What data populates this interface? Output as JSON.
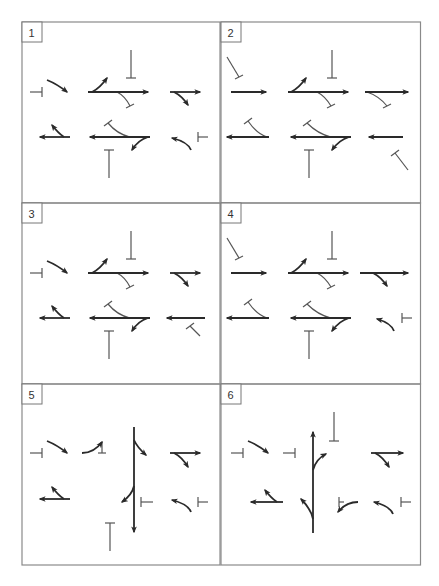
{
  "figure": {
    "grid": {
      "left": 22,
      "top": 22,
      "col_width": 199,
      "row_height": 181,
      "cols": 2,
      "rows": 3
    },
    "colors": {
      "border": "#8a8a8a",
      "arrow": "#2a2a2a",
      "stop_line": "#555555",
      "label_box": "#777777",
      "label_text": "#333333"
    },
    "panels": [
      {
        "label": "1",
        "arrows": [
          {
            "d": "M25 58 Q35 62 45 70"
          },
          {
            "d": "M66 70 L126 70"
          },
          {
            "d": "M70 70 Q78 66 85 56"
          },
          {
            "d": "M148 70 L178 70"
          },
          {
            "d": "M152 70 Q160 74 166 83"
          },
          {
            "d": "M48 115 L18 115"
          },
          {
            "d": "M42 115 Q36 111 30 103"
          },
          {
            "d": "M128 115 L68 115"
          },
          {
            "d": "M126 115 Q116 118 110 128"
          },
          {
            "d": "M169 128 Q166 120 150 116"
          }
        ],
        "stops": [
          {
            "d": "M8 70 L20 70",
            "cap": [
              20,
              65,
              20,
              75
            ]
          },
          {
            "d": "M109 28 L109 56",
            "cap": [
              104,
              56,
              114,
              56
            ]
          },
          {
            "d": "M95 70 Q103 74 108 84",
            "cap": [
              104,
              86,
              112,
              82
            ]
          },
          {
            "d": "M108 115 Q95 112 86 101",
            "cap": [
              82,
              104,
              90,
              98
            ]
          },
          {
            "d": "M87 156 L87 128",
            "cap": [
              82,
              128,
              92,
              128
            ]
          },
          {
            "d": "M186 115 L176 115",
            "cap": [
              176,
              110,
              176,
              120
            ]
          }
        ]
      },
      {
        "label": "2",
        "arrows": [
          {
            "d": "M10 70 L45 70"
          },
          {
            "d": "M67 70 L127 70"
          },
          {
            "d": "M70 70 Q78 66 85 56"
          },
          {
            "d": "M144 70 L187 70"
          },
          {
            "d": "M48 115 L6 115"
          },
          {
            "d": "M130 115 L70 115"
          },
          {
            "d": "M128 115 Q118 118 111 128"
          },
          {
            "d": "M182 115 L148 115"
          }
        ],
        "stops": [
          {
            "d": "M6 35 L18 55",
            "cap": [
              14,
              57,
              22,
              53
            ]
          },
          {
            "d": "M111 28 L111 56",
            "cap": [
              106,
              56,
              116,
              56
            ]
          },
          {
            "d": "M96 70 Q104 74 110 84",
            "cap": [
              106,
              86,
              114,
              82
            ]
          },
          {
            "d": "M146 70 Q158 74 166 84",
            "cap": [
              162,
              86,
              170,
              82
            ]
          },
          {
            "d": "M46 115 Q36 112 27 99",
            "cap": [
              23,
              102,
              31,
              96
            ]
          },
          {
            "d": "M110 115 Q97 112 86 101",
            "cap": [
              82,
              104,
              90,
              98
            ]
          },
          {
            "d": "M88 156 L88 128",
            "cap": [
              83,
              128,
              93,
              128
            ]
          },
          {
            "d": "M187 148 L174 131",
            "cap": [
              170,
              134,
              178,
              128
            ]
          }
        ]
      },
      {
        "label": "3",
        "arrows": [
          {
            "d": "M25 58 Q35 62 45 70"
          },
          {
            "d": "M66 70 L126 70"
          },
          {
            "d": "M70 70 Q78 66 85 56"
          },
          {
            "d": "M148 70 L178 70"
          },
          {
            "d": "M152 70 Q160 74 166 83"
          },
          {
            "d": "M48 115 L18 115"
          },
          {
            "d": "M42 115 Q36 111 30 103"
          },
          {
            "d": "M128 115 L68 115"
          },
          {
            "d": "M126 115 Q116 118 110 128"
          },
          {
            "d": "M183 115 L145 115"
          }
        ],
        "stops": [
          {
            "d": "M8 70 L20 70",
            "cap": [
              20,
              65,
              20,
              75
            ]
          },
          {
            "d": "M109 28 L109 56",
            "cap": [
              104,
              56,
              114,
              56
            ]
          },
          {
            "d": "M95 70 Q103 74 108 84",
            "cap": [
              104,
              86,
              112,
              82
            ]
          },
          {
            "d": "M108 115 Q95 112 86 101",
            "cap": [
              82,
              104,
              90,
              98
            ]
          },
          {
            "d": "M87 156 L87 128",
            "cap": [
              82,
              128,
              92,
              128
            ]
          },
          {
            "d": "M178 133 L168 123",
            "cap": [
              164,
              126,
              172,
              120
            ]
          }
        ]
      },
      {
        "label": "4",
        "arrows": [
          {
            "d": "M10 70 L45 70"
          },
          {
            "d": "M67 70 L127 70"
          },
          {
            "d": "M70 70 Q78 66 85 56"
          },
          {
            "d": "M139 70 L187 70"
          },
          {
            "d": "M152 70 Q160 74 166 83"
          },
          {
            "d": "M48 115 L6 115"
          },
          {
            "d": "M130 115 L70 115"
          },
          {
            "d": "M128 115 Q118 118 111 128"
          },
          {
            "d": "M173 128 Q170 120 156 116"
          }
        ],
        "stops": [
          {
            "d": "M6 35 L18 55",
            "cap": [
              14,
              57,
              22,
              53
            ]
          },
          {
            "d": "M111 28 L111 56",
            "cap": [
              106,
              56,
              116,
              56
            ]
          },
          {
            "d": "M96 70 Q104 74 110 84",
            "cap": [
              106,
              86,
              114,
              82
            ]
          },
          {
            "d": "M46 115 Q36 112 27 99",
            "cap": [
              23,
              102,
              31,
              96
            ]
          },
          {
            "d": "M110 115 Q97 112 86 101",
            "cap": [
              82,
              104,
              90,
              98
            ]
          },
          {
            "d": "M88 156 L88 128",
            "cap": [
              83,
              128,
              93,
              128
            ]
          },
          {
            "d": "M191 115 L181 115",
            "cap": [
              181,
              110,
              181,
              120
            ]
          }
        ]
      },
      {
        "label": "5",
        "arrows": [
          {
            "d": "M25 57 Q35 61 45 69"
          },
          {
            "d": "M60 69 Q72 69 80 58"
          },
          {
            "d": "M112 43 L112 148"
          },
          {
            "d": "M112 56 Q115 63 124 71"
          },
          {
            "d": "M112 102 Q110 111 100 118"
          },
          {
            "d": "M148 69 L178 69"
          },
          {
            "d": "M152 69 Q160 73 166 83"
          },
          {
            "d": "M48 115 L18 115"
          },
          {
            "d": "M42 115 Q36 111 30 103"
          },
          {
            "d": "M169 128 Q166 120 150 116"
          }
        ],
        "stops": [
          {
            "d": "M8 69 L20 69",
            "cap": [
              20,
              64,
              20,
              74
            ]
          },
          {
            "d": "M80 58 L80 69",
            "cap": [
              76,
              69,
              84,
              69
            ]
          },
          {
            "d": "M131 118 L119 118",
            "cap": [
              119,
              113,
              119,
              123
            ]
          },
          {
            "d": "M88 167 L88 139",
            "cap": [
              83,
              139,
              93,
              139
            ]
          },
          {
            "d": "M186 118 L176 118",
            "cap": [
              176,
              113,
              176,
              123
            ]
          }
        ]
      },
      {
        "label": "6",
        "arrows": [
          {
            "d": "M27 57 Q37 61 47 69"
          },
          {
            "d": "M92 149 L92 48"
          },
          {
            "d": "M92 86 Q95 75 105 70"
          },
          {
            "d": "M92 135 Q90 125 80 115"
          },
          {
            "d": "M150 69 L182 69"
          },
          {
            "d": "M154 69 Q162 73 168 83"
          },
          {
            "d": "M62 118 L30 118"
          },
          {
            "d": "M56 118 Q50 114 44 106"
          },
          {
            "d": "M137 118 Q125 118 117 128"
          },
          {
            "d": "M172 130 Q169 122 153 118"
          }
        ],
        "stops": [
          {
            "d": "M10 69 L22 69",
            "cap": [
              22,
              64,
              22,
              74
            ]
          },
          {
            "d": "M62 69 L74 69",
            "cap": [
              74,
              64,
              74,
              74
            ]
          },
          {
            "d": "M113 28 L113 57",
            "cap": [
              108,
              57,
              118,
              57
            ]
          },
          {
            "d": "M123 118 L118 118",
            "cap": [
              118,
              113,
              118,
              123
            ]
          },
          {
            "d": "M190 118 L180 118",
            "cap": [
              180,
              113,
              180,
              123
            ]
          }
        ]
      }
    ]
  }
}
